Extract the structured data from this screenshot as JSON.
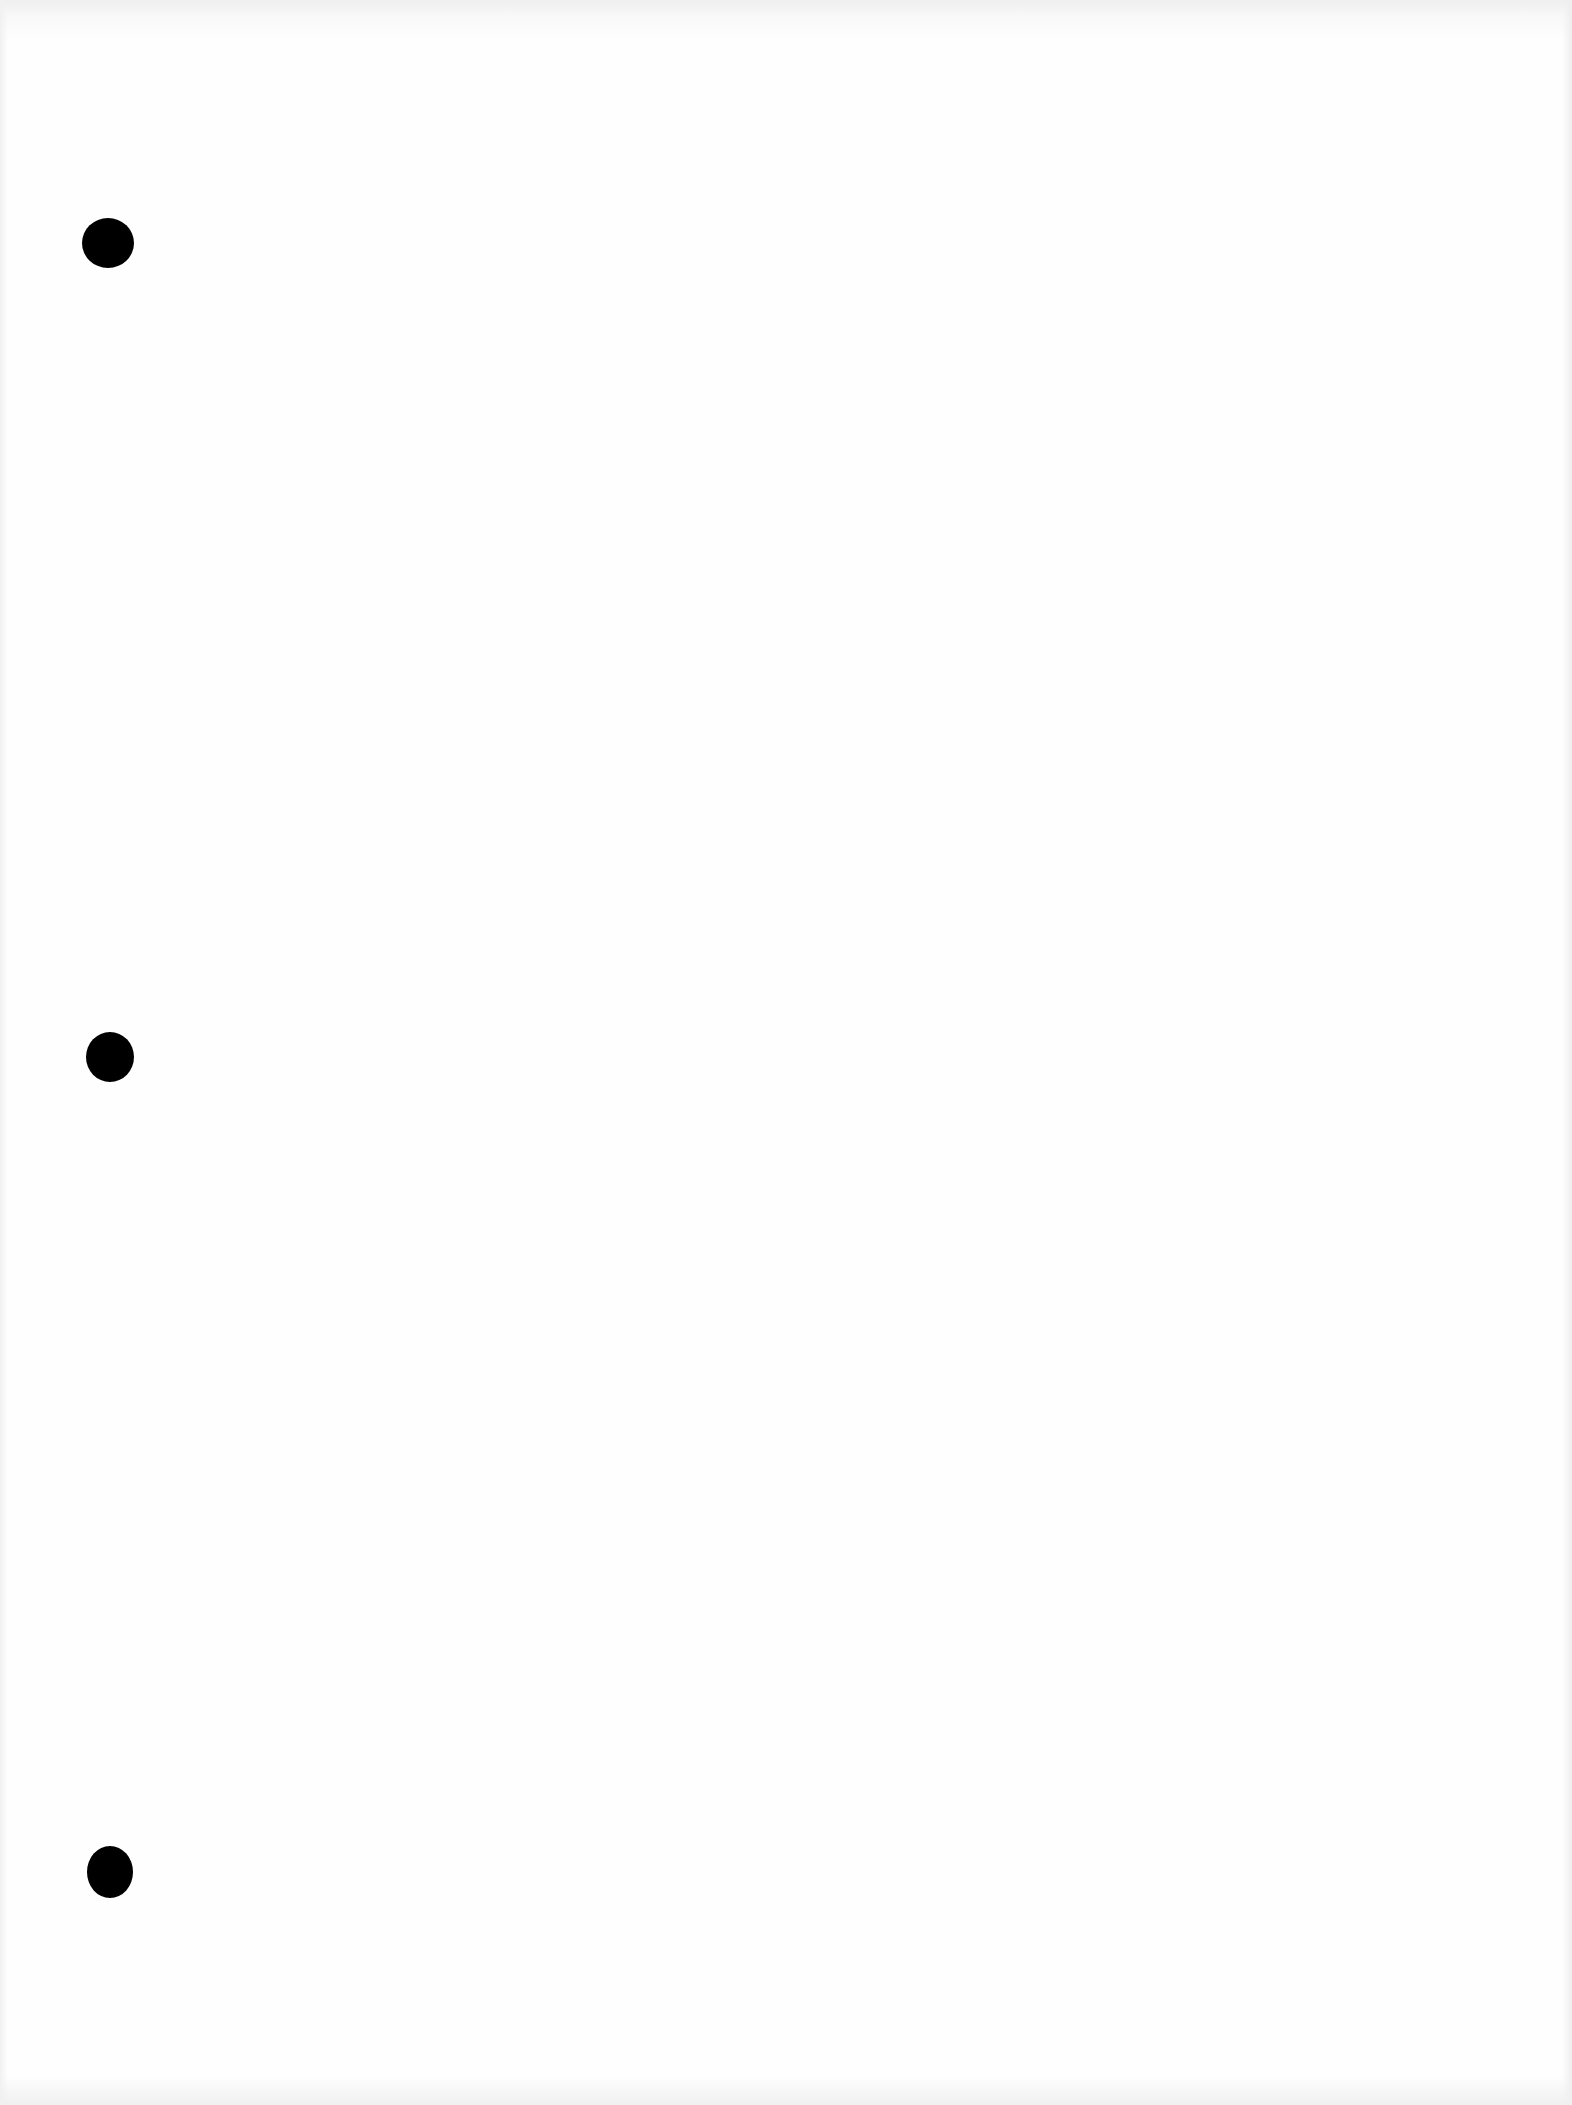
{
  "document": {
    "type": "blank punched sheet",
    "text": "",
    "background_color": "#ffffff",
    "holes": [
      {
        "cx": 108,
        "cy": 243,
        "w": 52,
        "h": 50,
        "color": "#000000"
      },
      {
        "cx": 110,
        "cy": 1057,
        "w": 48,
        "h": 50,
        "color": "#000000"
      },
      {
        "cx": 110,
        "cy": 1872,
        "w": 46,
        "h": 52,
        "color": "#000000"
      }
    ]
  }
}
